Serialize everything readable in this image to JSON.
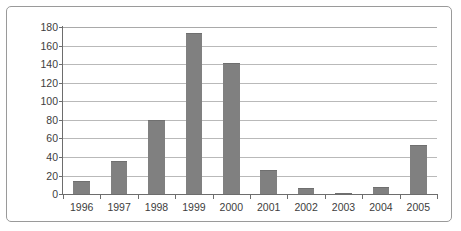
{
  "chart_data": {
    "type": "bar",
    "title": "",
    "xlabel": "",
    "ylabel": "",
    "categories": [
      "1996",
      "1997",
      "1998",
      "1999",
      "2000",
      "2001",
      "2002",
      "2003",
      "2004",
      "2005"
    ],
    "values": [
      14,
      36,
      80,
      174,
      141,
      26,
      6,
      1,
      8,
      53
    ],
    "series": [
      {
        "name": "series-1",
        "values": [
          14,
          36,
          80,
          174,
          141,
          26,
          6,
          1,
          8,
          53
        ],
        "color": "#808080"
      }
    ],
    "ylim": [
      0,
      180
    ],
    "ytick_labels": [
      "0",
      "20",
      "40",
      "60",
      "80",
      "100",
      "120",
      "140",
      "160",
      "180"
    ],
    "ytick_values": [
      0,
      20,
      40,
      60,
      80,
      100,
      120,
      140,
      160,
      180
    ],
    "grid": true,
    "legend": false,
    "legend_position": "none",
    "bar_color": "#808080",
    "gridline_color": "#b9b9b9",
    "axis_color": "#6d6d6d",
    "frame_color": "#9a9a9a",
    "background_color": "#ffffff"
  }
}
